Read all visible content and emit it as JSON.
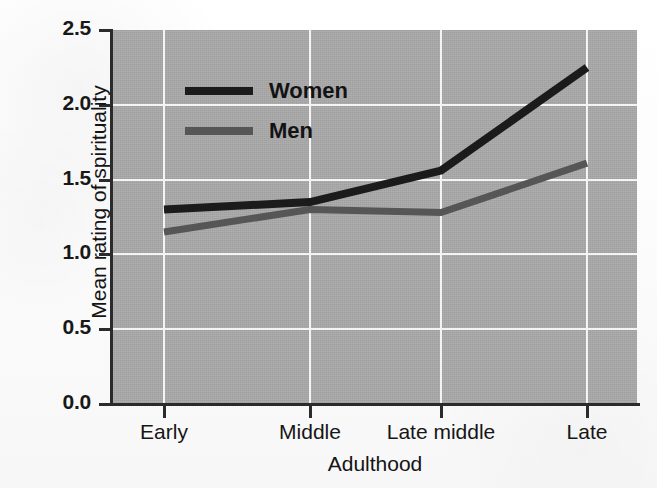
{
  "chart_data": {
    "type": "line",
    "title": "",
    "xlabel": "Adulthood",
    "ylabel": "Mean rating of spirituality",
    "categories": [
      "Early",
      "Middle",
      "Late middle",
      "Late"
    ],
    "ylim": [
      0.0,
      2.5
    ],
    "yticks": [
      "0.0",
      "0.5",
      "1.0",
      "1.5",
      "2.0",
      "2.5"
    ],
    "ytick_values": [
      0.0,
      0.5,
      1.0,
      1.5,
      2.0,
      2.5
    ],
    "grid": "both-axes-white-gridlines",
    "legend_position": "upper-left-inside-plot",
    "plot_background": "#a8a8a8",
    "series": [
      {
        "name": "Women",
        "color": "#1b1b1b",
        "values": [
          1.3,
          1.35,
          1.56,
          2.25
        ]
      },
      {
        "name": "Men",
        "color": "#565656",
        "values": [
          1.15,
          1.3,
          1.28,
          1.61
        ]
      }
    ]
  },
  "legend": {
    "items": [
      {
        "label": "Women",
        "color": "#1b1b1b"
      },
      {
        "label": "Men",
        "color": "#565656"
      }
    ]
  },
  "axes": {
    "y_title": "Mean rating of spirituality",
    "x_title": "Adulthood",
    "y_labels": [
      "2.5",
      "2.0",
      "1.5",
      "1.0",
      "0.5",
      "0.0"
    ],
    "x_labels": [
      "Early",
      "Middle",
      "Late middle",
      "Late"
    ]
  },
  "colors": {
    "axis": "#2b2b2b",
    "gridline": "#f4f4f4",
    "plot_bg": "#a8a8a8",
    "page_bg": "#fdfdfd",
    "women": "#1b1b1b",
    "men": "#565656"
  }
}
